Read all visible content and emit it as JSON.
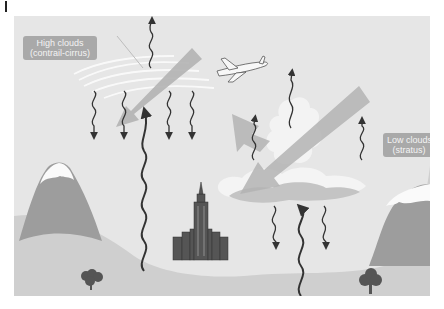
{
  "figure": {
    "corner_marker": "|",
    "labels": {
      "high_clouds": {
        "line1": "High clouds",
        "line2": "(contrail-cirrus)"
      },
      "low_clouds": {
        "line1": "Low clouds",
        "line2": "(stratus)"
      }
    },
    "elements": [
      "aircraft-icon",
      "contrail-cirrus-cloud",
      "stratus-cloud",
      "cumulus-cloud",
      "left-mountain",
      "right-mountain",
      "city-skyline",
      "tree-left",
      "tree-right",
      "solar-shortwave-arrow-high",
      "solar-shortwave-arrow-low",
      "longwave-radiation-squiggles"
    ],
    "colors": {
      "background_sky": "#e6e6e6",
      "ground": "#cfcfcf",
      "mountain": "#9d9d9d",
      "snow": "#fafafa",
      "arrow_solar": "#b3b3b3",
      "cloud_white": "#f4f4f4",
      "cloud_gray": "#c4c4c4",
      "squiggle": "#333333",
      "label_bg": "#a9a9a9",
      "label_text": "#f4f4f4"
    }
  }
}
